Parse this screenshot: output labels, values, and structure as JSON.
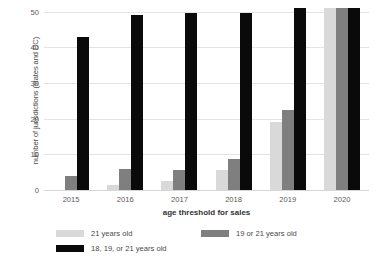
{
  "chart_data": {
    "type": "bar",
    "title": "",
    "xlabel": "age threshold for sales",
    "ylabel": "number of jurisdictions (states and DC)",
    "categories": [
      "2015",
      "2016",
      "2017",
      "2018",
      "2019",
      "2020"
    ],
    "series": [
      {
        "name": "21 years old",
        "color": "#d9d9d9",
        "values": [
          0,
          1.5,
          2.5,
          5.7,
          19,
          51
        ]
      },
      {
        "name": "19 or 21 years old",
        "color": "#7f7f7f",
        "values": [
          4,
          5.8,
          5.7,
          8.7,
          22.5,
          51
        ]
      },
      {
        "name": "18, 19, or 21 years old",
        "color": "#0a0a0a",
        "values": [
          43,
          49,
          49.7,
          49.6,
          51,
          51
        ]
      }
    ],
    "ylim": [
      0,
      51
    ],
    "yticks": [
      0,
      10,
      20,
      30,
      40,
      50
    ],
    "ytick_labels": [
      "0",
      "10",
      "20",
      "30",
      "40",
      "50"
    ],
    "grid": true,
    "legend_position": "bottom"
  }
}
